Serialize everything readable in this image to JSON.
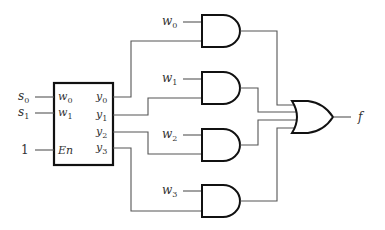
{
  "diagram": {
    "type": "logic-circuit",
    "decoder": {
      "inputs": [
        {
          "pin": "w",
          "sub": "0",
          "signal": "s",
          "signal_sub": "0"
        },
        {
          "pin": "w",
          "sub": "1",
          "signal": "s",
          "signal_sub": "1"
        },
        {
          "pin": "En",
          "signal": "1"
        }
      ],
      "outputs": [
        {
          "pin": "y",
          "sub": "0"
        },
        {
          "pin": "y",
          "sub": "1"
        },
        {
          "pin": "y",
          "sub": "2"
        },
        {
          "pin": "y",
          "sub": "3"
        }
      ]
    },
    "and_gates": [
      {
        "input_label": "w",
        "input_sub": "0"
      },
      {
        "input_label": "w",
        "input_sub": "1"
      },
      {
        "input_label": "w",
        "input_sub": "2"
      },
      {
        "input_label": "w",
        "input_sub": "3"
      }
    ],
    "or_gate": {
      "output_label": "f"
    }
  }
}
